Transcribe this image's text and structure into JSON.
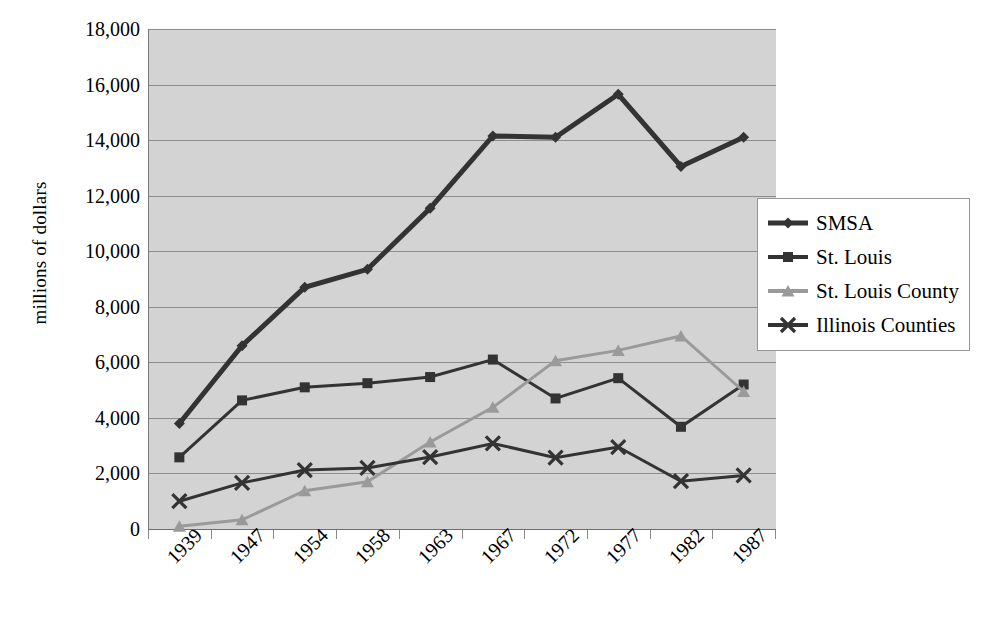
{
  "chart_data": {
    "type": "line",
    "title": "",
    "xlabel": "",
    "ylabel": "millions of dollars",
    "ylim": [
      0,
      18000
    ],
    "ytick_values": [
      0,
      2000,
      4000,
      6000,
      8000,
      10000,
      12000,
      14000,
      16000,
      18000
    ],
    "ytick_labels": [
      "0",
      "2,000",
      "4,000",
      "6,000",
      "8,000",
      "10,000",
      "12,000",
      "14,000",
      "16,000",
      "18,000"
    ],
    "categories": [
      "1939",
      "1947",
      "1954",
      "1958",
      "1963",
      "1967",
      "1972",
      "1977",
      "1982",
      "1987"
    ],
    "grid": "horizontal",
    "legend_position": "right",
    "plot_background": "#d3d3d3",
    "series": [
      {
        "name": "SMSA",
        "marker": "diamond",
        "color": "#333333",
        "line_width": 5,
        "values": [
          3800,
          6600,
          8700,
          9350,
          11550,
          14150,
          14100,
          15650,
          13050,
          14100
        ]
      },
      {
        "name": "St. Louis",
        "marker": "square",
        "color": "#333333",
        "line_width": 3,
        "values": [
          2580,
          4630,
          5100,
          5250,
          5470,
          6100,
          4700,
          5430,
          3680,
          5200
        ]
      },
      {
        "name": "St. Louis County",
        "marker": "triangle",
        "color": "#9a9a9a",
        "line_width": 3,
        "values": [
          100,
          330,
          1380,
          1700,
          3130,
          4380,
          6060,
          6430,
          6950,
          4950
        ]
      },
      {
        "name": "Illinois Counties",
        "marker": "x",
        "color": "#333333",
        "line_width": 3,
        "values": [
          1000,
          1660,
          2120,
          2200,
          2590,
          3080,
          2570,
          2950,
          1720,
          1930
        ]
      }
    ]
  },
  "legend": {
    "items": [
      {
        "label": "SMSA",
        "marker": "diamond",
        "color": "#333333",
        "line_width": 5
      },
      {
        "label": "St. Louis",
        "marker": "square",
        "color": "#333333",
        "line_width": 4
      },
      {
        "label": "St. Louis County",
        "marker": "triangle",
        "color": "#9a9a9a",
        "line_width": 4
      },
      {
        "label": "Illinois Counties",
        "marker": "x",
        "color": "#333333",
        "line_width": 4
      }
    ]
  }
}
